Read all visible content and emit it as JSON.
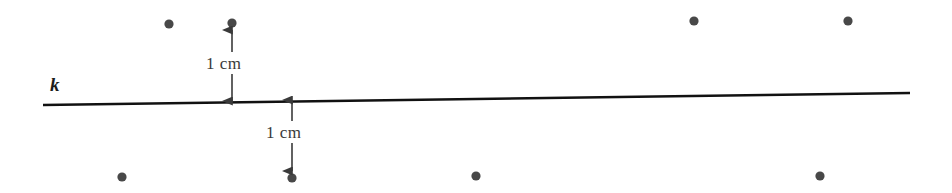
{
  "figure": {
    "type": "geometry-diagram",
    "background_color": "#ffffff",
    "width": 952,
    "height": 193,
    "line": {
      "name": "k",
      "label": "k",
      "label_x": 50,
      "label_y": 75,
      "color": "#111111",
      "x1": 43,
      "y1": 105,
      "x2": 910,
      "y2": 93,
      "thickness": 2.4
    },
    "dot_color": "#484848",
    "dot_radius": 4.6,
    "dots_above": [
      {
        "x": 169,
        "y": 24
      },
      {
        "x": 232,
        "y": 23
      },
      {
        "x": 694,
        "y": 21
      },
      {
        "x": 848,
        "y": 21
      }
    ],
    "dots_below": [
      {
        "x": 122,
        "y": 177
      },
      {
        "x": 292,
        "y": 178
      },
      {
        "x": 476,
        "y": 176
      },
      {
        "x": 820,
        "y": 176
      }
    ],
    "measurements": [
      {
        "id": "above",
        "text": "1 cm",
        "arrow_x": 232,
        "arrow_top_y": 30,
        "arrow_bottom_y": 101,
        "gap_top": 52,
        "gap_bottom": 74,
        "label_x": 206,
        "label_y": 55,
        "color": "#3a3a3a"
      },
      {
        "id": "below",
        "text": "1 cm",
        "arrow_x": 292,
        "arrow_top_y": 100,
        "arrow_bottom_y": 171,
        "gap_top": 121,
        "gap_bottom": 143,
        "label_x": 266,
        "label_y": 124,
        "color": "#3a3a3a"
      }
    ]
  }
}
